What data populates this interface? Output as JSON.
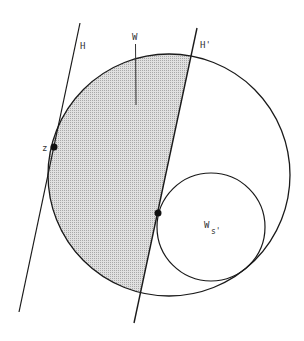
{
  "diagram": {
    "labels": {
      "H": "H",
      "H_prime": "H'",
      "W": "W",
      "z": "z",
      "Ws_main": "W",
      "Ws_sub": "s'"
    },
    "colors": {
      "stroke": "#1a1a1a",
      "shade": "#cfcfcf",
      "background": "#ffffff"
    },
    "shapes": {
      "big_circle": {
        "cx": 169,
        "cy": 175,
        "r": 121
      },
      "small_circle": {
        "cx": 211,
        "cy": 227,
        "r": 54
      },
      "line_H": {
        "x1": 80,
        "y1": 23,
        "x2": 19,
        "y2": 312
      },
      "line_H_prime": {
        "x1": 197,
        "y1": 28,
        "x2": 134,
        "y2": 323
      },
      "point_z": {
        "x": 54,
        "y": 147
      },
      "point_tangent": {
        "x": 158,
        "y": 213
      }
    }
  }
}
